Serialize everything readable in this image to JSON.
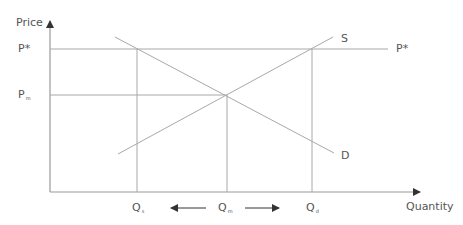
{
  "diagram": {
    "axes": {
      "y_label": "Price",
      "x_label": "Quantity",
      "origin": [
        50,
        192
      ],
      "y_top": 15,
      "x_right": 426,
      "color": "#9a9a9a"
    },
    "curves": [
      {
        "name": "S",
        "label": "S",
        "from": [
          118,
          154
        ],
        "to": [
          333,
          37
        ],
        "label_pos": [
          341,
          33
        ]
      },
      {
        "name": "D",
        "label": "D",
        "from": [
          115,
          37
        ],
        "to": [
          334,
          153
        ],
        "label_pos": [
          341,
          150
        ]
      }
    ],
    "price_lines": [
      {
        "name": "P*",
        "label": "P",
        "sup": "*",
        "y": 49,
        "x_end": 388,
        "label_pos": [
          18,
          43
        ],
        "right_label": "P*",
        "right_label_pos": [
          396,
          43
        ]
      },
      {
        "name": "Pm",
        "label": "P",
        "sub": "m",
        "y": 95,
        "x_end": 227,
        "label_pos": [
          18,
          89
        ]
      }
    ],
    "quantity_lines": [
      {
        "name": "Qs",
        "label": "Q",
        "sub": "s",
        "x": 137,
        "y_top": 49,
        "label_pos": [
          132,
          202
        ]
      },
      {
        "name": "Qm",
        "label": "Q",
        "sub": "m",
        "x": 227,
        "y_top": 95,
        "label_pos": [
          218,
          202
        ]
      },
      {
        "name": "Qd",
        "label": "Q",
        "sub": "d",
        "x": 312,
        "y_top": 49,
        "label_pos": [
          306,
          202
        ]
      }
    ],
    "arrows": [
      {
        "name": "shift-left-arrow",
        "from": [
          206,
          208
        ],
        "to": [
          171,
          208
        ]
      },
      {
        "name": "shift-right-arrow",
        "from": [
          245,
          208
        ],
        "to": [
          279,
          208
        ]
      }
    ],
    "line_color": "#a8a8a8",
    "text_color": "#555555"
  }
}
